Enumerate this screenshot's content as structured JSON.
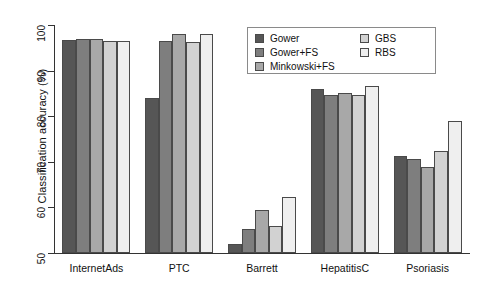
{
  "chart_data": {
    "type": "bar",
    "title": "",
    "xlabel": "",
    "ylabel": "Classification accuracy (%)",
    "ylim": [
      50,
      100
    ],
    "yticks": [
      50,
      60,
      70,
      80,
      90,
      100
    ],
    "grid": false,
    "legend_position": "top-right",
    "categories": [
      "InternetAds",
      "PTC",
      "Barrett",
      "HepatitisC",
      "Psoriasis"
    ],
    "series": [
      {
        "name": "Gower",
        "color": "#565656",
        "values": [
          96.8,
          84.0,
          52.0,
          86.0,
          71.2
        ]
      },
      {
        "name": "Gower+FS",
        "color": "#7e7e7e",
        "values": [
          97.0,
          96.5,
          55.2,
          84.6,
          70.6
        ]
      },
      {
        "name": "Minkowski+FS",
        "color": "#a8a8a8",
        "values": [
          97.0,
          98.0,
          59.4,
          85.0,
          68.8
        ]
      },
      {
        "name": "GBS",
        "color": "#d2d2d2",
        "values": [
          96.4,
          96.2,
          56.0,
          84.6,
          72.4
        ]
      },
      {
        "name": "RBS",
        "color": "#efefef",
        "values": [
          96.4,
          98.0,
          62.2,
          86.6,
          79.0
        ]
      }
    ]
  },
  "legend": {
    "entries_left": [
      "Gower",
      "Gower+FS",
      "Minkowski+FS"
    ],
    "entries_right": [
      "GBS",
      "RBS"
    ]
  }
}
